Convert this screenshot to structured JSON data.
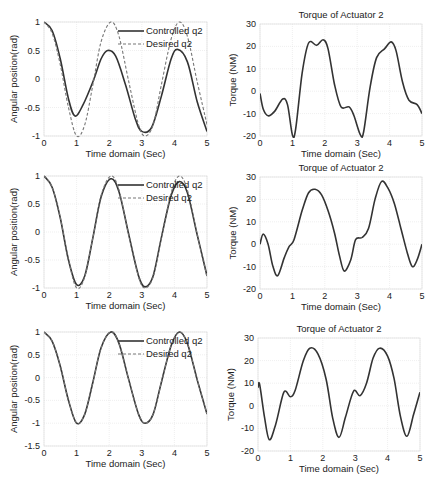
{
  "chart_data": [
    {
      "id": "row1-left",
      "type": "line",
      "title": "",
      "xlabel": "Time domain (Sec)",
      "ylabel": "Angular position(rad)",
      "xlim": [
        0,
        5
      ],
      "ylim": [
        -1,
        1
      ],
      "xticks": [
        "0",
        "1",
        "2",
        "3",
        "4",
        "5"
      ],
      "yticks": [
        "-1",
        "-0.5",
        "0",
        "0.5",
        "1"
      ],
      "grid": true,
      "legend": {
        "position": "upper-right",
        "entries": [
          "Controlled q2",
          "Desired q2"
        ]
      },
      "series": [
        {
          "name": "Controlled q2",
          "style": "solid",
          "x": [
            0,
            0.25,
            0.5,
            0.75,
            0.95,
            1.2,
            1.5,
            1.75,
            1.95,
            2.2,
            2.5,
            2.8,
            3.0,
            3.3,
            3.6,
            3.9,
            4.1,
            4.4,
            4.7,
            5.0
          ],
          "y": [
            1,
            0.85,
            0.35,
            -0.35,
            -0.65,
            -0.45,
            -0.05,
            0.35,
            0.5,
            0.4,
            -0.1,
            -0.7,
            -0.92,
            -0.85,
            -0.3,
            0.35,
            0.52,
            0.3,
            -0.4,
            -0.92
          ]
        },
        {
          "name": "Desired q2",
          "style": "dashed",
          "x": [
            0,
            0.25,
            0.5,
            0.75,
            1.0,
            1.25,
            1.5,
            1.75,
            2.05,
            2.3,
            2.6,
            2.9,
            3.1,
            3.35,
            3.6,
            3.9,
            4.15,
            4.4,
            4.7,
            5.0
          ],
          "y": [
            1,
            0.8,
            0.25,
            -0.5,
            -1.0,
            -0.8,
            -0.1,
            0.65,
            1.0,
            0.75,
            -0.05,
            -0.8,
            -1.0,
            -0.8,
            -0.1,
            0.7,
            1.0,
            0.75,
            -0.05,
            -0.8
          ]
        }
      ]
    },
    {
      "id": "row1-right",
      "type": "line",
      "title": "Torque of Actuator 2",
      "xlabel": "Time domain (Sec)",
      "ylabel": "Torque (NM)",
      "xlim": [
        0,
        5
      ],
      "ylim": [
        -20,
        30
      ],
      "xticks": [
        "0",
        "1",
        "2",
        "3",
        "4",
        "5"
      ],
      "yticks": [
        "-20",
        "-10",
        "0",
        "10",
        "20",
        "30"
      ],
      "grid": true,
      "series": [
        {
          "name": "Torque",
          "style": "solid",
          "x": [
            0,
            0.1,
            0.25,
            0.45,
            0.7,
            0.85,
            1.0,
            1.1,
            1.3,
            1.5,
            1.75,
            1.95,
            2.1,
            2.3,
            2.5,
            2.75,
            2.9,
            3.1,
            3.2,
            3.4,
            3.6,
            3.85,
            4.05,
            4.2,
            4.4,
            4.6,
            4.85,
            5.0
          ],
          "y": [
            -1,
            -8,
            -11,
            -9,
            -3.5,
            -6,
            -19.5,
            -17,
            8,
            21.5,
            20.5,
            23,
            19,
            3,
            -7,
            -7,
            -11,
            -19.5,
            -18,
            2,
            15,
            19,
            22,
            18,
            4,
            -4,
            -6,
            -10
          ]
        }
      ]
    },
    {
      "id": "row2-left",
      "type": "line",
      "title": "",
      "xlabel": "Time domain (Sec)",
      "ylabel": "Angular position(rad)",
      "xlim": [
        0,
        5
      ],
      "ylim": [
        -1,
        1
      ],
      "xticks": [
        "0",
        "1",
        "2",
        "3",
        "4",
        "5"
      ],
      "yticks": [
        "-1",
        "-0.5",
        "0",
        "0.5",
        "1"
      ],
      "grid": true,
      "legend": {
        "position": "upper-right",
        "entries": [
          "Controlled q2",
          "Desired q2"
        ]
      },
      "series": [
        {
          "name": "Controlled q2",
          "style": "solid",
          "x": [
            0,
            0.25,
            0.5,
            0.75,
            1.0,
            1.25,
            1.5,
            1.75,
            2.05,
            2.3,
            2.6,
            2.9,
            3.1,
            3.35,
            3.6,
            3.9,
            4.15,
            4.4,
            4.7,
            5.0
          ],
          "y": [
            1,
            0.8,
            0.25,
            -0.5,
            -0.94,
            -0.78,
            -0.1,
            0.62,
            0.95,
            0.72,
            -0.05,
            -0.78,
            -0.98,
            -0.78,
            -0.1,
            0.65,
            0.9,
            0.7,
            -0.05,
            -0.78
          ]
        },
        {
          "name": "Desired q2",
          "style": "dashed",
          "x": [
            0,
            0.25,
            0.5,
            0.75,
            1.0,
            1.25,
            1.5,
            1.75,
            2.05,
            2.3,
            2.6,
            2.9,
            3.1,
            3.35,
            3.6,
            3.9,
            4.15,
            4.4,
            4.7,
            5.0
          ],
          "y": [
            1,
            0.8,
            0.25,
            -0.5,
            -1.0,
            -0.8,
            -0.1,
            0.65,
            1.0,
            0.75,
            -0.05,
            -0.8,
            -1.0,
            -0.8,
            -0.1,
            0.7,
            1.0,
            0.75,
            -0.05,
            -0.8
          ]
        }
      ]
    },
    {
      "id": "row2-right",
      "type": "line",
      "title": "Torque of Actuator 2",
      "xlabel": "Time domain (Sec)",
      "ylabel": "Torque (NM)",
      "xlim": [
        0,
        5
      ],
      "ylim": [
        -20,
        30
      ],
      "xticks": [
        "0",
        "1",
        "2",
        "3",
        "4",
        "5"
      ],
      "yticks": [
        "-20",
        "-10",
        "0",
        "10",
        "20",
        "30"
      ],
      "grid": true,
      "series": [
        {
          "name": "Torque",
          "style": "solid",
          "x": [
            0,
            0.1,
            0.25,
            0.4,
            0.55,
            0.75,
            0.9,
            1.05,
            1.3,
            1.5,
            1.7,
            1.9,
            2.1,
            2.3,
            2.45,
            2.6,
            2.8,
            2.95,
            3.15,
            3.35,
            3.55,
            3.75,
            3.95,
            4.15,
            4.35,
            4.55,
            4.7,
            4.85,
            5.0
          ],
          "y": [
            0,
            4.5,
            0,
            -10,
            -14,
            -6,
            -1,
            2,
            15,
            23,
            24.5,
            22,
            15,
            5,
            -5,
            -12,
            -7,
            2,
            3,
            7,
            20,
            28,
            25,
            18,
            7,
            -4,
            -10,
            -7,
            0
          ]
        }
      ]
    },
    {
      "id": "row3-left",
      "type": "line",
      "title": "",
      "xlabel": "Time domain (Sec)",
      "ylabel": "Angular position(rad)",
      "xlim": [
        0,
        5
      ],
      "ylim": [
        -1.5,
        1
      ],
      "xticks": [
        "0",
        "1",
        "2",
        "3",
        "4",
        "5"
      ],
      "yticks": [
        "-1.5",
        "-1",
        "-0.5",
        "0",
        "0.5",
        "1"
      ],
      "grid": true,
      "legend": {
        "position": "upper-right",
        "entries": [
          "Controlled q2",
          "Desired q2"
        ]
      },
      "series": [
        {
          "name": "Controlled q2",
          "style": "solid",
          "x": [
            0,
            0.25,
            0.5,
            0.75,
            1.0,
            1.25,
            1.5,
            1.75,
            2.05,
            2.3,
            2.6,
            2.9,
            3.1,
            3.35,
            3.6,
            3.9,
            4.15,
            4.4,
            4.7,
            5.0
          ],
          "y": [
            1,
            0.8,
            0.25,
            -0.5,
            -1.0,
            -0.8,
            -0.1,
            0.65,
            1.0,
            0.75,
            -0.05,
            -0.8,
            -1.0,
            -0.8,
            -0.1,
            0.7,
            1.0,
            0.75,
            -0.05,
            -0.8
          ]
        },
        {
          "name": "Desired q2",
          "style": "dashed",
          "x": [
            0,
            0.25,
            0.5,
            0.75,
            1.0,
            1.25,
            1.5,
            1.75,
            2.05,
            2.3,
            2.6,
            2.9,
            3.1,
            3.35,
            3.6,
            3.9,
            4.15,
            4.4,
            4.7,
            5.0
          ],
          "y": [
            1,
            0.8,
            0.25,
            -0.5,
            -1.0,
            -0.8,
            -0.1,
            0.65,
            1.0,
            0.75,
            -0.05,
            -0.8,
            -1.0,
            -0.8,
            -0.1,
            0.7,
            1.0,
            0.75,
            -0.05,
            -0.8
          ]
        }
      ]
    },
    {
      "id": "row3-right",
      "type": "line",
      "title": "Torque of Actuator 2",
      "xlabel": "Time domain (Sec)",
      "ylabel": "Torque (NM)",
      "xlim": [
        0,
        5
      ],
      "ylim": [
        -20,
        30
      ],
      "xticks": [
        "0",
        "1",
        "2",
        "3",
        "4",
        "5"
      ],
      "yticks": [
        "-20",
        "-10",
        "0",
        "10",
        "20",
        "30"
      ],
      "grid": true,
      "series": [
        {
          "name": "Torque",
          "style": "solid",
          "x": [
            0,
            0.05,
            0.2,
            0.35,
            0.55,
            0.8,
            1.0,
            1.15,
            1.4,
            1.6,
            1.85,
            2.1,
            2.3,
            2.5,
            2.7,
            2.95,
            3.15,
            3.35,
            3.55,
            3.75,
            4.0,
            4.2,
            4.4,
            4.6,
            4.8,
            5.0
          ],
          "y": [
            8,
            9.5,
            -5,
            -15,
            -8,
            6,
            4,
            7,
            20,
            25.5,
            23,
            12,
            -5,
            -14,
            -5,
            6.5,
            4.5,
            10,
            21,
            25.5,
            22,
            12,
            -5,
            -13.5,
            -4,
            6
          ]
        }
      ]
    }
  ]
}
